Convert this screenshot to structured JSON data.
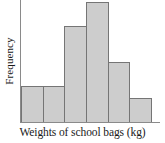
{
  "chart_data": {
    "type": "bar",
    "title": "",
    "xlabel": "Weights of school bags (kg)",
    "ylabel": "Frequency",
    "categories": [
      "1",
      "2",
      "3",
      "4",
      "5",
      "6"
    ],
    "values": [
      3,
      3,
      8,
      10,
      5,
      2
    ],
    "ylim": [
      0,
      10.2
    ],
    "grid": false,
    "legend": null,
    "tick_labels_x": [],
    "tick_labels_y": [],
    "bar_fill_color": "#cdcdcd",
    "bar_edge_color": "#757575",
    "axis_color": "#8a8a8a",
    "text_color": "#1a1a1a",
    "background_color": "#ffffff"
  }
}
